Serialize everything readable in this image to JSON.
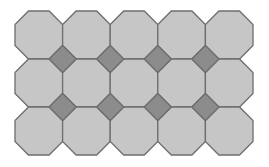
{
  "figure": {
    "columns": 5,
    "rows": 3,
    "origin": [
      15,
      11
    ],
    "cell_width": 47.6,
    "cell_height": 48,
    "bevel": 13.5,
    "colors": {
      "background": "#ffffff",
      "octagon_fill": "#c6c6c6",
      "square_fill": "#8c8c8c",
      "stroke": "#6e6e6e"
    }
  }
}
